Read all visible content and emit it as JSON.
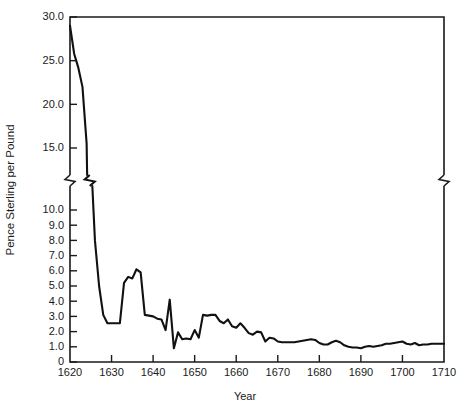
{
  "chart_data": {
    "type": "line",
    "title": "",
    "xlabel": "Year",
    "ylabel": "Pence Sterling per Pound",
    "xlim": [
      1620,
      1710
    ],
    "ylim": [
      0,
      30
    ],
    "grid": false,
    "legend": null,
    "axis_break": {
      "present": true,
      "axis": "y",
      "between": [
        10.0,
        15.0
      ],
      "note": "zigzag break mark on y-axis, plot frame and data line"
    },
    "xticks": [
      1620,
      1630,
      1640,
      1650,
      1660,
      1670,
      1680,
      1690,
      1700,
      1710
    ],
    "xtick_labels": [
      "1620",
      "1630",
      "1640",
      "1650",
      "1660",
      "1670",
      "1680",
      "1690",
      "1700",
      "1710"
    ],
    "yticks": [
      0,
      1,
      2,
      3,
      4,
      5,
      6,
      7,
      8,
      9,
      10,
      15,
      20,
      25,
      30
    ],
    "ytick_labels": [
      "0",
      "1.0",
      "2.0",
      "3.0",
      "4.0",
      "5.0",
      "6.0",
      "7.0",
      "8.0",
      "9.0",
      "10.0",
      "15.0",
      "20.0",
      "25.0",
      "30.0"
    ],
    "line_color": "#111111",
    "x": [
      1620,
      1621,
      1622,
      1623,
      1624,
      1625,
      1626,
      1627,
      1628,
      1629,
      1630,
      1631,
      1632,
      1633,
      1634,
      1635,
      1636,
      1637,
      1638,
      1639,
      1640,
      1641,
      1642,
      1643,
      1644,
      1645,
      1646,
      1647,
      1648,
      1649,
      1650,
      1651,
      1652,
      1653,
      1654,
      1655,
      1656,
      1657,
      1658,
      1659,
      1660,
      1661,
      1662,
      1663,
      1664,
      1665,
      1666,
      1667,
      1668,
      1669,
      1670,
      1671,
      1672,
      1673,
      1674,
      1675,
      1676,
      1677,
      1678,
      1679,
      1680,
      1681,
      1682,
      1683,
      1684,
      1685,
      1686,
      1687,
      1688,
      1689,
      1690,
      1691,
      1692,
      1693,
      1694,
      1695,
      1696,
      1697,
      1698,
      1699,
      1700,
      1701,
      1702,
      1703,
      1704,
      1705,
      1706,
      1707,
      1708,
      1709,
      1710
    ],
    "values": [
      29.0,
      25.8,
      24.2,
      22.0,
      15.5,
      11.5,
      8.0,
      5.0,
      3.1,
      2.55,
      2.55,
      2.55,
      2.55,
      5.2,
      5.6,
      5.5,
      6.1,
      5.9,
      3.1,
      3.05,
      3.0,
      2.85,
      2.8,
      2.1,
      4.1,
      0.9,
      1.95,
      1.5,
      1.55,
      1.5,
      2.1,
      1.6,
      3.1,
      3.05,
      3.1,
      3.1,
      2.7,
      2.55,
      2.8,
      2.35,
      2.25,
      2.55,
      2.25,
      1.9,
      1.8,
      2.0,
      1.95,
      1.35,
      1.6,
      1.55,
      1.35,
      1.3,
      1.3,
      1.3,
      1.3,
      1.35,
      1.4,
      1.45,
      1.5,
      1.45,
      1.25,
      1.15,
      1.15,
      1.3,
      1.4,
      1.3,
      1.1,
      1.0,
      0.95,
      0.95,
      0.9,
      1.0,
      1.05,
      1.0,
      1.05,
      1.1,
      1.2,
      1.2,
      1.25,
      1.3,
      1.35,
      1.2,
      1.15,
      1.25,
      1.1,
      1.15,
      1.15,
      1.2,
      1.2,
      1.2,
      1.2
    ]
  }
}
